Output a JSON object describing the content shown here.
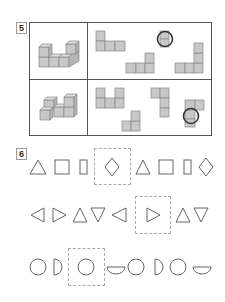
{
  "question5": {
    "number": "5",
    "rows": [
      {
        "model": "3D cube structure (U-shape)",
        "pieces": [
          "L-tromino piece",
          "L-tetromino piece",
          "J-pentomino piece"
        ],
        "circled_answer": "small piece (circled)"
      },
      {
        "model": "3D cube structure (H-shape)",
        "pieces": [
          "U-pentomino piece",
          "L-tromino piece",
          "J-tetromino piece",
          "T-piece (circled)"
        ],
        "circled_answer": "T-piece (circled)"
      }
    ]
  },
  "question6": {
    "number": "6",
    "rows": [
      {
        "sequence": [
          "triangle-up",
          "square",
          "rectangle",
          "diamond",
          "triangle-up",
          "square",
          "rectangle",
          "diamond"
        ],
        "boxed_index": 3
      },
      {
        "sequence": [
          "triangle-left",
          "triangle-right",
          "triangle-up",
          "triangle-down",
          "triangle-left",
          "triangle-right",
          "triangle-up",
          "triangle-down"
        ],
        "boxed_index": 5
      },
      {
        "sequence": [
          "circle",
          "half-circle-right",
          "circle",
          "half-circle-bottom",
          "circle",
          "half-circle-right",
          "circle",
          "half-circle-bottom"
        ],
        "boxed_index": 2
      }
    ]
  },
  "colors": {
    "cube_fill": "#c8c8c8",
    "line": "#555555",
    "shape_stroke": "#666666",
    "circle_mark": "#333333",
    "dash": "#aaaaaa"
  }
}
